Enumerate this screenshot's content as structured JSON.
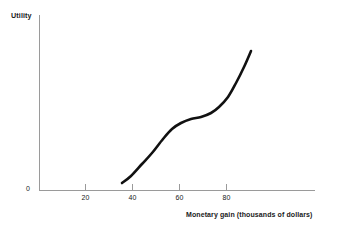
{
  "chart_data": {
    "type": "line",
    "title": "",
    "xlabel": "Monetary gain (thousands of dollars)",
    "ylabel": "Utility",
    "origin_label": "0",
    "xlim": [
      0,
      100
    ],
    "ylim": [
      0,
      100
    ],
    "xticks": [
      20,
      40,
      60,
      80
    ],
    "xtick_labels": [
      "20",
      "40",
      "60",
      "80"
    ],
    "yticks": [],
    "ytick_labels": [],
    "grid": false,
    "legend": null,
    "series": [
      {
        "name": "Utility function",
        "color": "#111111",
        "linewidth": 2.6,
        "x": [
          36,
          40,
          45,
          50,
          55,
          60,
          65,
          70,
          75,
          80,
          85,
          90
        ],
        "y": [
          4,
          12,
          23,
          33,
          41,
          47,
          51,
          53,
          58,
          67,
          79,
          93
        ],
        "points_px": [
          [
            122,
            183
          ],
          [
            131,
            176
          ],
          [
            142,
            164
          ],
          [
            152,
            153
          ],
          [
            163,
            139
          ],
          [
            172,
            129
          ],
          [
            181,
            123
          ],
          [
            191,
            119
          ],
          [
            201,
            117
          ],
          [
            211,
            113
          ],
          [
            219,
            107
          ],
          [
            228,
            97
          ],
          [
            236,
            83
          ],
          [
            244,
            67
          ],
          [
            251,
            51
          ]
        ]
      }
    ]
  },
  "axes": {
    "x_axis_name": "x-axis",
    "y_axis_name": "y-axis",
    "axis_color": "#9a9a9a"
  }
}
